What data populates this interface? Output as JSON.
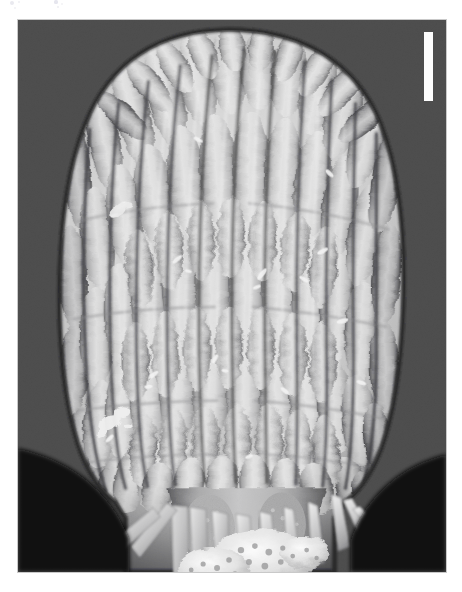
{
  "page": {
    "background_color": "#ffffff",
    "width": 462,
    "height": 592,
    "caption": ""
  },
  "figure": {
    "type": "scanning-electron-micrograph",
    "subject_description": "Dome-topped barrel-shaped specimen covered in longitudinal rows of elongated sausage-shaped lobes, tapering to a narrow stalk bearing spine-like scales and a granular debris mass at the base",
    "background_color": "#050505",
    "border_color": "#c9c9c9",
    "panel": {
      "x": 17,
      "y": 19,
      "width": 430,
      "height": 554
    },
    "specimen_tone_light": "#dcdcdc",
    "specimen_tone_mid": "#b4b4b4",
    "specimen_tone_dark": "#6e6e6e",
    "furrow_tone": "#4a4a4a",
    "column_count": 15,
    "lobe_rows": 7
  },
  "scale_bar": {
    "label": "",
    "color": "#fdfdfd",
    "orientation": "vertical",
    "x": 424,
    "y": 32,
    "width": 9,
    "height": 69
  },
  "artifacts": {
    "specks": [
      {
        "x": 12,
        "y": 3,
        "r": 2.0,
        "color": "#e9e9ef"
      },
      {
        "x": 19,
        "y": 2,
        "r": 1.4,
        "color": "#efeff3"
      },
      {
        "x": 15,
        "y": 8,
        "r": 1.1,
        "color": "#f1f1f4"
      },
      {
        "x": 56,
        "y": 2,
        "r": 1.6,
        "color": "#e6e6ee"
      },
      {
        "x": 58,
        "y": 7,
        "r": 1.2,
        "color": "#eeeef2"
      },
      {
        "x": 62,
        "y": 4,
        "r": 1.0,
        "color": "#f2f2f5"
      }
    ]
  }
}
